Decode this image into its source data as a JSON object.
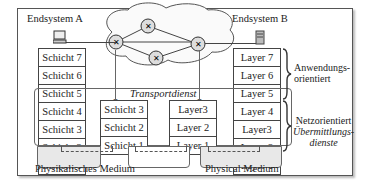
{
  "endsystem_a": {
    "title": "Endsystem A",
    "icon": "computer-icon",
    "layers": [
      "Schicht 7",
      "Schicht 6",
      "Schicht 5",
      "Schicht 4",
      "Schicht 3",
      "Schicht 2",
      "Schicht 1"
    ]
  },
  "endsystem_b": {
    "title": "Endsystem B",
    "icon": "server-icon",
    "layers": [
      "Layer 7",
      "Layer 6",
      "Layer 5",
      "Layer 4",
      "Layer3",
      "Layer 2",
      "Layer 1"
    ]
  },
  "intermediate_a": {
    "layers": [
      "Schicht 3",
      "Schicht 2",
      "Schicht 1"
    ]
  },
  "intermediate_b": {
    "layers": [
      "Layer3",
      "Layer 2",
      "Layer 1"
    ]
  },
  "network": {
    "icon": "cloud-network-icon",
    "router_count": 4,
    "router_icon": "router-icon"
  },
  "transport_label": "Transportdienst",
  "braces": {
    "upper": {
      "line1": "Anwendungs-",
      "line2": "orientiert"
    },
    "lower": {
      "line1": "Netzorientiert",
      "line2": "Übermittlungs-",
      "line3": "dienste"
    }
  },
  "media": {
    "left": "Physikalisches Medium",
    "right": "Physical Medium"
  },
  "colors": {
    "border": "#444444",
    "medium_fill": "#e8e8e8",
    "background": "#ffffff"
  }
}
